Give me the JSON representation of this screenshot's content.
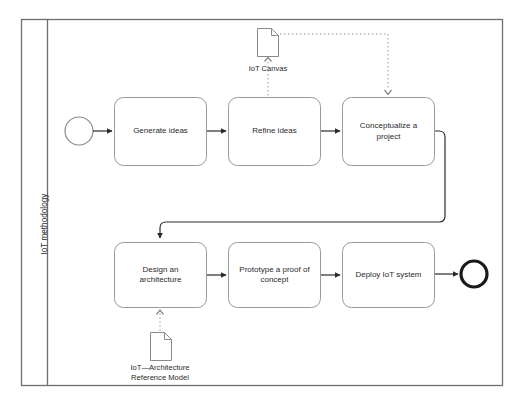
{
  "diagram": {
    "type": "bpmn-process",
    "pool": {
      "lane_label": "IoT methodology"
    },
    "events": [
      {
        "id": "start",
        "kind": "start-event",
        "label": ""
      },
      {
        "id": "end",
        "kind": "end-event",
        "label": ""
      }
    ],
    "tasks": [
      {
        "id": "t1",
        "label": "Generate ideas"
      },
      {
        "id": "t2",
        "label": "Refine ideas"
      },
      {
        "id": "t3",
        "label": "Conceptualize a\nproject"
      },
      {
        "id": "t4",
        "label": "Design an\narchitecture"
      },
      {
        "id": "t5",
        "label": "Prototype a proof of\nconcept"
      },
      {
        "id": "t6",
        "label": "Deploy IoT system"
      }
    ],
    "artifacts": [
      {
        "id": "d1",
        "kind": "data-object",
        "label": "IoT Canvas"
      },
      {
        "id": "d2",
        "kind": "data-object",
        "label": "IoT—Architecture\nReference Model"
      }
    ],
    "flows": [
      {
        "from": "start",
        "to": "t1",
        "kind": "sequence"
      },
      {
        "from": "t1",
        "to": "t2",
        "kind": "sequence"
      },
      {
        "from": "t2",
        "to": "t3",
        "kind": "sequence"
      },
      {
        "from": "t3",
        "to": "t4",
        "kind": "sequence"
      },
      {
        "from": "t4",
        "to": "t5",
        "kind": "sequence"
      },
      {
        "from": "t5",
        "to": "t6",
        "kind": "sequence"
      },
      {
        "from": "t6",
        "to": "end",
        "kind": "sequence"
      },
      {
        "from": "d1",
        "to": "t2",
        "kind": "association"
      },
      {
        "from": "d1",
        "to": "t3",
        "kind": "association"
      },
      {
        "from": "d2",
        "to": "t4",
        "kind": "association"
      }
    ],
    "colors": {
      "stroke": "#7a7a7a",
      "flow_stroke": "#2b2b2b",
      "text": "#2b2b2b",
      "background": "#ffffff",
      "pool_border": "#6e6e6e"
    }
  }
}
